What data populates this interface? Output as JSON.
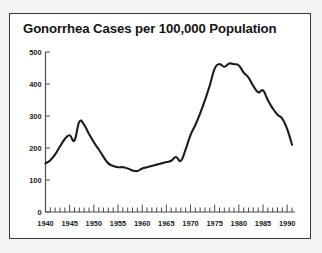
{
  "figure": {
    "background_color": "#f4f4f4",
    "panel_color": "#ffffff",
    "border_color": "#3a3a3a"
  },
  "chart_data": {
    "type": "line",
    "title": "Gonorrhea Cases per 100,000 Population",
    "xlabel": "",
    "ylabel": "",
    "xlim": [
      1940,
      1991
    ],
    "ylim": [
      0,
      500
    ],
    "grid": false,
    "legend": false,
    "line_color": "#1c1c1c",
    "y_ticks": [
      0,
      100,
      200,
      300,
      400,
      500
    ],
    "y_tick_labels": [
      "0",
      "100",
      "200",
      "300",
      "400",
      "500"
    ],
    "x_ticks": [
      1940,
      1945,
      1950,
      1955,
      1960,
      1965,
      1970,
      1975,
      1980,
      1985,
      1990
    ],
    "x_tick_labels": [
      "1940",
      "1945",
      "1950",
      "1955",
      "1960",
      "1965",
      "1970",
      "1975",
      "1980",
      "1985",
      "1990"
    ],
    "x_minor_tick_interval": 1,
    "x": [
      1940,
      1941,
      1942,
      1943,
      1944,
      1945,
      1946,
      1947,
      1948,
      1949,
      1950,
      1951,
      1952,
      1953,
      1954,
      1955,
      1956,
      1957,
      1958,
      1959,
      1960,
      1961,
      1962,
      1963,
      1964,
      1965,
      1966,
      1967,
      1968,
      1969,
      1970,
      1971,
      1972,
      1973,
      1974,
      1975,
      1976,
      1977,
      1978,
      1979,
      1980,
      1981,
      1982,
      1983,
      1984,
      1985,
      1986,
      1987,
      1988,
      1989,
      1990,
      1991
    ],
    "values": [
      152,
      162,
      180,
      205,
      228,
      240,
      224,
      282,
      272,
      244,
      218,
      196,
      172,
      152,
      144,
      140,
      140,
      136,
      130,
      128,
      136,
      140,
      144,
      148,
      152,
      156,
      160,
      172,
      160,
      196,
      240,
      272,
      308,
      350,
      396,
      448,
      462,
      454,
      464,
      462,
      458,
      436,
      420,
      394,
      374,
      380,
      350,
      324,
      304,
      292,
      260,
      210
    ],
    "annotations": []
  }
}
